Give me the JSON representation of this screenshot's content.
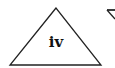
{
  "diagram": {
    "shapes": [
      {
        "type": "triangle",
        "label": "iv",
        "stroke": "#222222"
      },
      {
        "type": "partial-inverted-triangle",
        "label": "",
        "stroke": "#222222"
      }
    ]
  }
}
